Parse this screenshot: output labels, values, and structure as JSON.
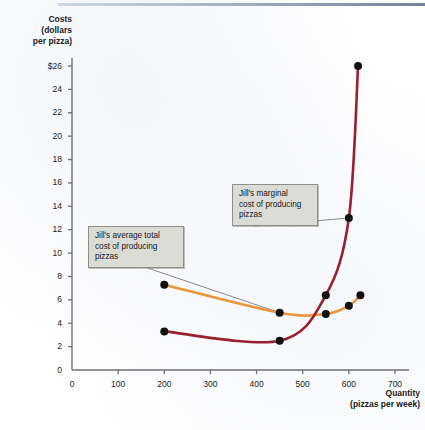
{
  "figure": {
    "background_color": "#ffffff",
    "axis_color": "#6f6f74"
  },
  "chart_data": {
    "type": "line",
    "title": "",
    "xlabel": "Quantity",
    "xlabel_sub": "(pizzas per week)",
    "ylabel": "Costs",
    "ylabel_sub1": "(dollars",
    "ylabel_sub2": "per pizza)",
    "xlim": [
      0,
      700
    ],
    "ylim": [
      0,
      27
    ],
    "grid": false,
    "legend": "none",
    "xticks": [
      0,
      100,
      200,
      300,
      400,
      500,
      600,
      700
    ],
    "xtick_labels": [
      "0",
      "100",
      "200",
      "300",
      "400",
      "500",
      "600",
      "700"
    ],
    "yticks": [
      0,
      2,
      4,
      6,
      8,
      10,
      12,
      14,
      16,
      18,
      20,
      22,
      24,
      26
    ],
    "ytick_labels": [
      "0",
      "2",
      "4",
      "6",
      "8",
      "10",
      "12",
      "14",
      "16",
      "18",
      "20",
      "22",
      "24",
      "$26"
    ],
    "series": [
      {
        "name": "Jill's average total cost of producing pizzas",
        "short_name": "ATC",
        "color": "#e8963c",
        "marker_color": "#111111",
        "points": [
          {
            "x": 200,
            "y": 7.3
          },
          {
            "x": 450,
            "y": 4.9
          },
          {
            "x": 550,
            "y": 4.8
          },
          {
            "x": 600,
            "y": 5.5
          },
          {
            "x": 625,
            "y": 6.4
          }
        ]
      },
      {
        "name": "Jill's marginal cost of producing pizzas",
        "short_name": "MC",
        "color": "#99202e",
        "marker_color": "#111111",
        "points": [
          {
            "x": 200,
            "y": 3.3
          },
          {
            "x": 450,
            "y": 2.5
          },
          {
            "x": 550,
            "y": 6.4
          },
          {
            "x": 600,
            "y": 13.0
          },
          {
            "x": 620,
            "y": 26.0
          }
        ]
      }
    ],
    "annotations": [
      {
        "id": "atc",
        "lines": [
          "Jill's average total",
          "cost of producing",
          "pizzas"
        ],
        "target_x": 450,
        "target_y": 4.9
      },
      {
        "id": "mc",
        "lines": [
          "Jill's marginal",
          "cost of producing",
          "pizzas"
        ],
        "target_x": 600,
        "target_y": 13.0
      }
    ]
  }
}
